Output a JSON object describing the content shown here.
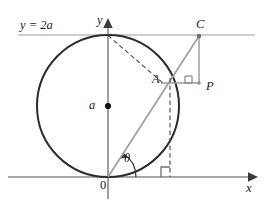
{
  "figure": {
    "background_color": "#ffffff",
    "axes": {
      "x_label": "x",
      "y_label": "y",
      "origin_label": "0",
      "axis_color": "#808080",
      "x_axis_y": 177,
      "y_axis_x": 108,
      "x_axis_start": 8,
      "x_axis_end": 252,
      "y_axis_top": 22,
      "y_axis_bottom": 199
    },
    "horizontal_line": {
      "label": "y = 2a",
      "y": 35,
      "x_start": 18,
      "x_end": 255,
      "color": "#b9b9b9"
    },
    "circle": {
      "center_x": 108,
      "center_y": 106,
      "radius": 71,
      "stroke_color": "#2b2b2b",
      "stroke_width": 2,
      "center_dot_label": "a",
      "center_dot_color": "#111111"
    },
    "points": [
      {
        "name": "A",
        "label": "A",
        "x": 162,
        "y": 83,
        "on": "circle"
      },
      {
        "name": "C",
        "label": "C",
        "x": 199,
        "y": 35,
        "on": "y = 2a line"
      },
      {
        "name": "P",
        "label": "P",
        "x": 199,
        "y": 83,
        "on": "horizontal through A"
      }
    ],
    "angle": {
      "label": "θ",
      "vertex": "origin",
      "between": "x-axis and ray OC",
      "arc_radius": 26
    },
    "segments": [
      {
        "name": "ray-O-to-C",
        "from": "origin",
        "to": "C",
        "style": "solid",
        "color": "#9a9a9a"
      },
      {
        "name": "segment-A-to-P",
        "from": "A",
        "to": "P",
        "style": "solid",
        "color": "#9a9a9a"
      },
      {
        "name": "segment-C-to-P",
        "from": "C",
        "to": "P",
        "style": "solid",
        "color": "#9a9a9a"
      },
      {
        "name": "dashed-top-to-A",
        "from": "circle top (0,2a)",
        "to": "A",
        "style": "dashed",
        "color": "#555555"
      },
      {
        "name": "dashed-A-to-xaxis",
        "from": "A",
        "to": "x-axis foot",
        "style": "dashed",
        "color": "#555555"
      }
    ],
    "right_angle_marks": [
      {
        "name": "right-angle-at-P",
        "x": 185,
        "y": 77
      },
      {
        "name": "right-angle-on-x-axis",
        "x": 162,
        "y": 165
      }
    ]
  }
}
